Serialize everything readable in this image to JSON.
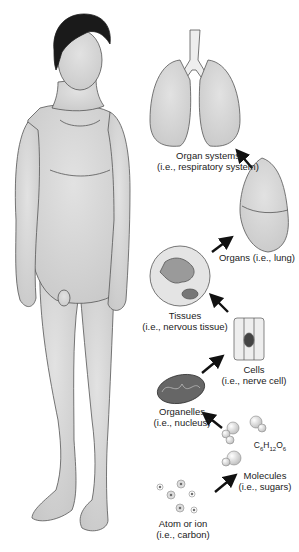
{
  "diagram": {
    "levels": [
      {
        "id": "atom",
        "title": "Atom or ion",
        "example": "(i.e., carbon)"
      },
      {
        "id": "molecules",
        "title": "Molecules",
        "example": "(i.e., sugars)",
        "formula": "C6H12O6"
      },
      {
        "id": "organelles",
        "title": "Organelles",
        "example": "(i.e., nucleus)"
      },
      {
        "id": "cells",
        "title": "Cells",
        "example": "(i.e., nerve cell)"
      },
      {
        "id": "tissues",
        "title": "Tissues",
        "example": "(i.e., nervous tissue)"
      },
      {
        "id": "organs",
        "title": "Organs (i.e., lung)"
      },
      {
        "id": "organ_systems",
        "title": "Organ systems",
        "example": "(i.e., respiratory system)"
      },
      {
        "id": "organism",
        "title": "Human organism"
      }
    ],
    "formula": {
      "c": "C",
      "c_sub": "6",
      "h": "H",
      "h_sub": "12",
      "o": "O",
      "o_sub": "6"
    },
    "colors": {
      "figure_fill": "#d4d4d4",
      "outline": "#555555",
      "hair": "#1a1a1a",
      "arrow": "#111111",
      "organelle": "#666666"
    }
  }
}
